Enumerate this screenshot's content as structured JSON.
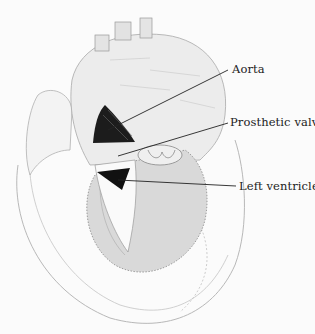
{
  "figure": {
    "labels": [
      {
        "id": "aorta",
        "text": "Aorta"
      },
      {
        "id": "prosthetic-valve",
        "text": "Prosthetic valve"
      },
      {
        "id": "left-ventricle",
        "text": "Left ventricle"
      }
    ]
  }
}
